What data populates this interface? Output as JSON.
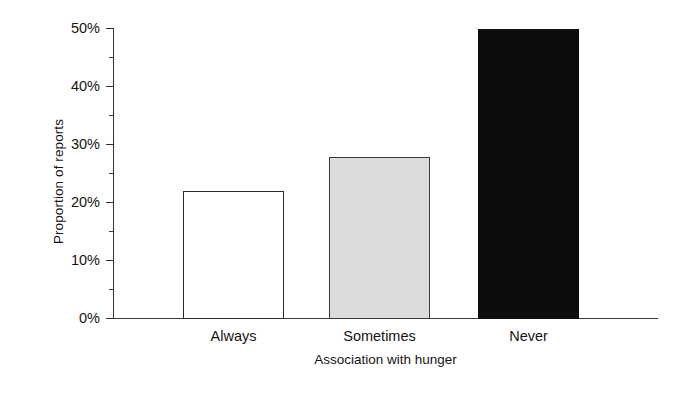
{
  "chart_data": {
    "type": "bar",
    "title": "",
    "xlabel": "Association with hunger",
    "ylabel": "Proportion of reports",
    "categories": [
      "Always",
      "Sometimes",
      "Never"
    ],
    "values": [
      22,
      28,
      50
    ],
    "value_labels": [
      "22%",
      "28%",
      "50%"
    ],
    "series": [
      {
        "name": "Proportion of reports",
        "values": [
          22,
          28,
          50
        ]
      }
    ],
    "ylim": [
      0,
      50
    ],
    "ytick_values": [
      0,
      10,
      20,
      30,
      40,
      50
    ],
    "ytick_labels": [
      "0%",
      "10%",
      "20%",
      "30%",
      "40%",
      "50%"
    ],
    "yminor_tick_values": [
      5,
      15,
      25,
      35,
      45
    ],
    "grid": false,
    "legend": null,
    "legend_position": "none",
    "bar_styles": [
      "open",
      "gray",
      "solid"
    ],
    "bar_style_colors": {
      "open_fill": "#ffffff",
      "open_edge": "#2b2b2b",
      "gray_fill": "#dcdcdc",
      "gray_edge": "#3a3a3a",
      "solid_fill": "#0d0d0d",
      "solid_edge": "#0d0d0d"
    },
    "axis_color": "#333333",
    "background": "#ffffff"
  }
}
